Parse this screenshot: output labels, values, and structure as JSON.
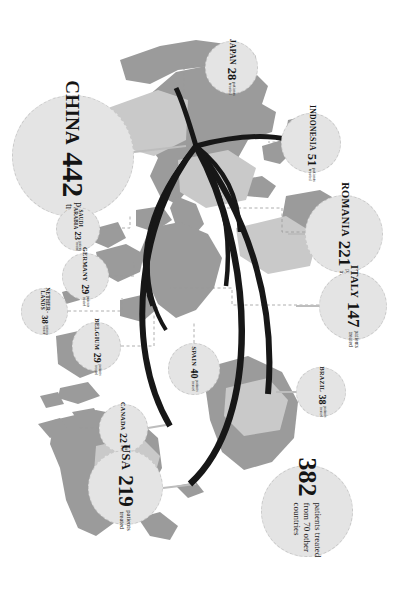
{
  "figure": {
    "type": "map-infographic",
    "orientation_degrees": 90,
    "background_color": "#ffffff",
    "land_color": "#9b9b9b",
    "land_color_light": "#c8c8c8",
    "bubble_fill": "#e4e4e4",
    "bubble_border": "#c9c9c9",
    "flow_color": "#171717",
    "leader_line_color": "#8f8f8f"
  },
  "labels": {
    "patients_treated": "patients\ntreated",
    "sub_line_1": "patients",
    "sub_line_2": "treated"
  },
  "chart_data": {
    "type": "bar",
    "xlabel": "Country",
    "ylabel": "Patients treated",
    "categories": [
      "CHINA",
      "ROMANIA",
      "USA",
      "ITALY",
      "INDONESIA",
      "SPAIN",
      "NETHER-LANDS",
      "BRAZIL",
      "GERMANY",
      "BELGIUM",
      "JAPAN",
      "SAUDI ARABIA",
      "CANADA",
      "70 other countries"
    ],
    "values": [
      442,
      221,
      219,
      147,
      51,
      40,
      38,
      38,
      29,
      29,
      28,
      23,
      22,
      382
    ],
    "ylim": [
      0,
      450
    ],
    "grid": false,
    "legend": false
  },
  "bubbles": [
    {
      "id": "china",
      "country": "CHINA",
      "value": "442",
      "sub1": "patients",
      "sub2": "treated",
      "size": 122,
      "x": 12,
      "y": 95,
      "tier": "sz-xxl"
    },
    {
      "id": "japan",
      "country": "JAPAN",
      "value": "28",
      "sub1": "patients",
      "sub2": "treated",
      "size": 53,
      "x": 205,
      "y": 41,
      "tier": "sz-m"
    },
    {
      "id": "indonesia",
      "country": "INDONESIA",
      "value": "51",
      "sub1": "patients",
      "sub2": "treated",
      "size": 60,
      "x": 281,
      "y": 113,
      "tier": "sz-m"
    },
    {
      "id": "romania",
      "country": "ROMANIA",
      "value": "221",
      "sub1": "patients",
      "sub2": "treated",
      "size": 78,
      "x": 305,
      "y": 195,
      "tier": "sz-l"
    },
    {
      "id": "italy",
      "country": "ITALY",
      "value": "147",
      "sub1": "patients",
      "sub2": "treated",
      "size": 68,
      "x": 319,
      "y": 272,
      "tier": "sz-l"
    },
    {
      "id": "saudi-arabia",
      "country": "SAUDI ARABIA",
      "value": "23",
      "sub1": "patients",
      "sub2": "treated",
      "size": 44,
      "x": 56,
      "y": 207,
      "tier": "sz-xs",
      "two_line_name": true
    },
    {
      "id": "germany",
      "country": "GERMANY",
      "value": "29",
      "sub1": "patients",
      "sub2": "treated",
      "size": 47,
      "x": 62,
      "y": 253,
      "tier": "sz-s"
    },
    {
      "id": "netherlands",
      "country": "NETHER-LANDS",
      "value": "38",
      "sub1": "patients",
      "sub2": "treated",
      "size": 47,
      "x": 21,
      "y": 288,
      "tier": "sz-xs",
      "two_line_name": true
    },
    {
      "id": "belgium",
      "country": "BELGIUM",
      "value": "29",
      "sub1": "patients",
      "sub2": "treated",
      "size": 49,
      "x": 72,
      "y": 322,
      "tier": "sz-s"
    },
    {
      "id": "spain",
      "country": "SPAIN",
      "value": "40",
      "sub1": "patients",
      "sub2": "treated",
      "size": 52,
      "x": 168,
      "y": 343,
      "tier": "sz-s"
    },
    {
      "id": "brazil",
      "country": "BRAZIL",
      "value": "38",
      "sub1": "patients",
      "sub2": "treated",
      "size": 50,
      "x": 296,
      "y": 367,
      "tier": "sz-s"
    },
    {
      "id": "canada",
      "country": "CANADA",
      "value": "22",
      "sub1": "patients",
      "sub2": "treated",
      "size": 49,
      "x": 99,
      "y": 404,
      "tier": "sz-s"
    },
    {
      "id": "usa",
      "country": "USA",
      "value": "219",
      "sub1": "patients",
      "sub2": "treated",
      "size": 75,
      "x": 88,
      "y": 450,
      "tier": "sz-xl"
    }
  ],
  "other_bubble": {
    "id": "other-countries",
    "value": "382",
    "text": "patients treated from 70 other countries",
    "size": 92,
    "x": 261,
    "y": 465
  }
}
